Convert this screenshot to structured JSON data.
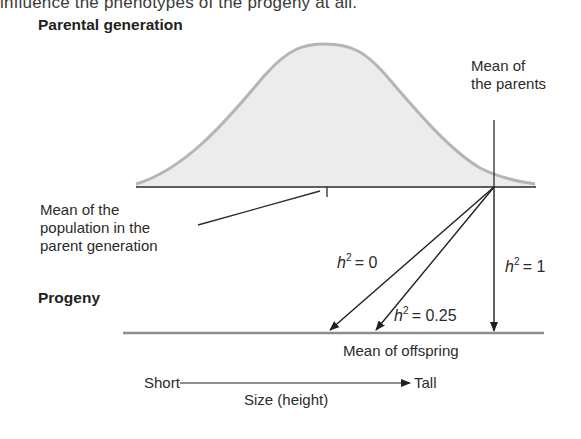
{
  "intro_text": "influence the phenotypes of the progeny at all.",
  "diagram": {
    "parental_heading": "Parental generation",
    "progeny_heading": "Progeny",
    "mean_of_parents": [
      "Mean of",
      "the parents"
    ],
    "population_mean": [
      "Mean of the",
      "population in the",
      "parent generation"
    ],
    "mean_of_offspring": "Mean of offspring",
    "heritability_arrows": [
      {
        "symbol": "h",
        "exponent": "2",
        "value": "= 0",
        "target_x": 329
      },
      {
        "symbol": "h",
        "exponent": "2",
        "value": "= 0.25",
        "target_x": 375
      },
      {
        "symbol": "h",
        "exponent": "2",
        "value": "= 1",
        "target_x": 494
      }
    ],
    "axis": {
      "left_label": "Short",
      "right_label": "Tall",
      "title": "Size (height)"
    },
    "colors": {
      "curve_fill": "#ededed",
      "curve_stroke": "#b3b3b3",
      "line": "#231f20",
      "progeny_line": "#8a8a8a"
    }
  }
}
